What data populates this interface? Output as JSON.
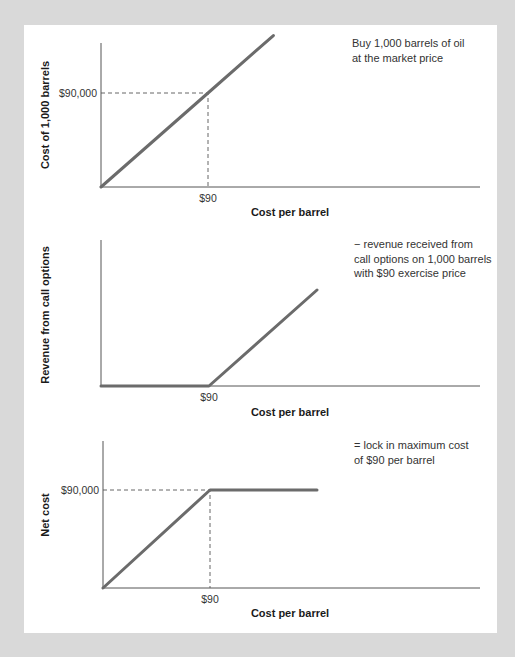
{
  "colors": {
    "background": "#d9d9d9",
    "panel": "#ffffff",
    "series": "#6b6b6b",
    "axis": "#555555",
    "text": "#1a1a1a"
  },
  "chart_data": [
    {
      "type": "line",
      "title": "",
      "annotation": [
        "Buy 1,000 barrels of oil",
        "at the market price"
      ],
      "xlabel": "Cost per barrel",
      "ylabel": "Cost of 1,000 barrels",
      "x_ticks": [
        {
          "value": 90,
          "label": "$90"
        }
      ],
      "y_ticks": [
        {
          "value": 90000,
          "label": "$90,000"
        }
      ],
      "series": [
        {
          "name": "Cost of 1,000 barrels",
          "x": [
            0,
            90,
            145
          ],
          "y": [
            0,
            90000,
            145000
          ]
        }
      ],
      "guides": [
        {
          "x": 90,
          "y": 90000
        }
      ],
      "grid": false
    },
    {
      "type": "line",
      "title": "",
      "annotation": [
        "− revenue received from",
        "call options on 1,000 barrels",
        "with $90 exercise price"
      ],
      "xlabel": "Cost per barrel",
      "ylabel": "Revenue from call options",
      "x_ticks": [
        {
          "value": 90,
          "label": "$90"
        }
      ],
      "y_ticks": [],
      "series": [
        {
          "name": "Revenue from call options",
          "x": [
            0,
            90,
            180
          ],
          "y": [
            0,
            0,
            90000
          ]
        }
      ],
      "guides": [],
      "grid": false
    },
    {
      "type": "line",
      "title": "",
      "annotation": [
        "= lock in maximum cost",
        "of $90 per barrel"
      ],
      "xlabel": "Cost per barrel",
      "ylabel": "Net cost",
      "x_ticks": [
        {
          "value": 90,
          "label": "$90"
        }
      ],
      "y_ticks": [
        {
          "value": 90000,
          "label": "$90,000"
        }
      ],
      "series": [
        {
          "name": "Net cost",
          "x": [
            0,
            90,
            180
          ],
          "y": [
            0,
            90000,
            90000
          ]
        }
      ],
      "guides": [
        {
          "x": 90,
          "y": 90000
        }
      ],
      "grid": false
    }
  ]
}
